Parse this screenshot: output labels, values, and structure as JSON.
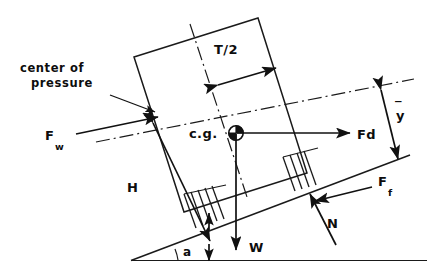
{
  "diagram": {
    "stroke_color": "#1a1a1a",
    "background_color": "#ffffff",
    "labels": {
      "center_of_pressure_line1": "center of",
      "center_of_pressure_line2": "pressure",
      "force_wind": "F",
      "force_wind_sub": "w",
      "force_drag": "Fd",
      "force_friction": "F",
      "force_friction_sub": "f",
      "normal_force": "N",
      "weight": "W",
      "height": "H",
      "half_thickness": "T/2",
      "y_bar": "y",
      "y_bar_overbar": "‾",
      "center_of_gravity": "c.g.",
      "incline_angle": "a"
    },
    "annotations": [
      {
        "name": "center-of-pressure",
        "text": "center of pressure",
        "kind": "leader-label"
      },
      {
        "name": "force-wind",
        "text": "Fw",
        "kind": "force-vector",
        "direction": "up-right along incline"
      },
      {
        "name": "force-drag",
        "text": "Fd",
        "kind": "force-vector",
        "direction": "horizontal right"
      },
      {
        "name": "force-friction",
        "text": "Ff",
        "kind": "force-vector",
        "direction": "down-left along incline"
      },
      {
        "name": "normal-force",
        "text": "N",
        "kind": "force-vector",
        "direction": "perpendicular to incline"
      },
      {
        "name": "weight",
        "text": "W",
        "kind": "force-vector",
        "direction": "vertically down"
      },
      {
        "name": "height",
        "text": "H",
        "kind": "dimension",
        "direction": "along block left edge"
      },
      {
        "name": "half-thickness",
        "text": "T/2",
        "kind": "dimension",
        "direction": "across block top"
      },
      {
        "name": "y-bar",
        "text": "ȳ",
        "kind": "dimension",
        "direction": "perpendicular from incline"
      },
      {
        "name": "incline-angle",
        "text": "a",
        "kind": "angle",
        "direction": "between incline and horizontal"
      }
    ]
  }
}
